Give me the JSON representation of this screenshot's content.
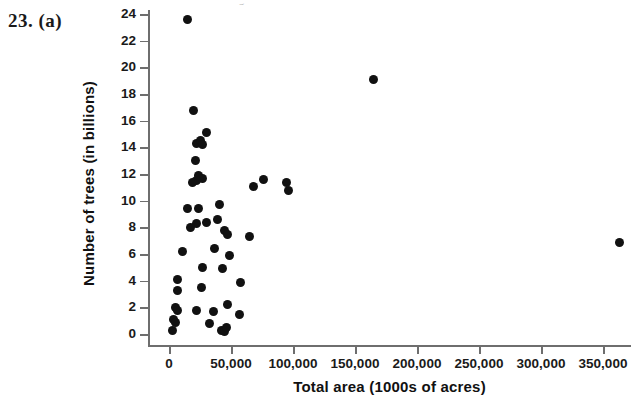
{
  "exercise": {
    "number": "23.",
    "part": "(a)"
  },
  "bleed_artifact": {
    "text": "g"
  },
  "chart_data": {
    "type": "scatter",
    "title": "",
    "xlabel": "Total area (1000s of acres)",
    "ylabel": "Number of trees (in billions)",
    "xlim": [
      -8000,
      390000
    ],
    "ylim": [
      0,
      24
    ],
    "xticks": [
      0,
      50000,
      100000,
      150000,
      200000,
      250000,
      300000,
      350000
    ],
    "xticklabels": [
      "0",
      "50,000",
      "100,000",
      "150,000",
      "200,000",
      "250,000",
      "300,000",
      "350,000"
    ],
    "yticks": [
      0,
      2,
      4,
      6,
      8,
      10,
      12,
      14,
      16,
      18,
      20,
      22,
      24
    ],
    "yticklabels": [
      "0",
      "2",
      "4",
      "6",
      "8",
      "10",
      "12",
      "14",
      "16",
      "18",
      "20",
      "22",
      "24"
    ],
    "grid": false,
    "legend": null,
    "marker": {
      "shape": "circle",
      "color": "#111111",
      "size": 9
    },
    "points": [
      {
        "x": 15000,
        "y": 23.6
      },
      {
        "x": 165000,
        "y": 19.1
      },
      {
        "x": 20000,
        "y": 16.8
      },
      {
        "x": 30000,
        "y": 15.1
      },
      {
        "x": 22000,
        "y": 14.3
      },
      {
        "x": 25000,
        "y": 14.5
      },
      {
        "x": 27000,
        "y": 14.2
      },
      {
        "x": 21000,
        "y": 13.0
      },
      {
        "x": 24000,
        "y": 11.9
      },
      {
        "x": 27000,
        "y": 11.7
      },
      {
        "x": 22000,
        "y": 11.5
      },
      {
        "x": 19000,
        "y": 11.4
      },
      {
        "x": 76000,
        "y": 11.6
      },
      {
        "x": 95000,
        "y": 11.4
      },
      {
        "x": 68000,
        "y": 11.1
      },
      {
        "x": 96000,
        "y": 10.8
      },
      {
        "x": 41000,
        "y": 9.7
      },
      {
        "x": 15000,
        "y": 9.4
      },
      {
        "x": 24000,
        "y": 9.4
      },
      {
        "x": 39000,
        "y": 8.6
      },
      {
        "x": 22000,
        "y": 8.3
      },
      {
        "x": 30000,
        "y": 8.4
      },
      {
        "x": 17000,
        "y": 8.0
      },
      {
        "x": 45000,
        "y": 7.8
      },
      {
        "x": 47000,
        "y": 7.5
      },
      {
        "x": 65000,
        "y": 7.3
      },
      {
        "x": 11000,
        "y": 6.2
      },
      {
        "x": 37000,
        "y": 6.4
      },
      {
        "x": 49000,
        "y": 5.9
      },
      {
        "x": 363000,
        "y": 6.9
      },
      {
        "x": 27000,
        "y": 5.0
      },
      {
        "x": 43000,
        "y": 4.9
      },
      {
        "x": 7000,
        "y": 4.1
      },
      {
        "x": 7000,
        "y": 3.3
      },
      {
        "x": 26000,
        "y": 3.5
      },
      {
        "x": 58000,
        "y": 3.9
      },
      {
        "x": 47000,
        "y": 2.2
      },
      {
        "x": 5000,
        "y": 2.0
      },
      {
        "x": 7000,
        "y": 1.8
      },
      {
        "x": 22000,
        "y": 1.8
      },
      {
        "x": 36000,
        "y": 1.7
      },
      {
        "x": 57000,
        "y": 1.5
      },
      {
        "x": 4000,
        "y": 1.1
      },
      {
        "x": 5000,
        "y": 0.9
      },
      {
        "x": 33000,
        "y": 0.8
      },
      {
        "x": 3000,
        "y": 0.3
      },
      {
        "x": 42000,
        "y": 0.3
      },
      {
        "x": 45000,
        "y": 0.2
      },
      {
        "x": 46000,
        "y": 0.5
      }
    ]
  }
}
